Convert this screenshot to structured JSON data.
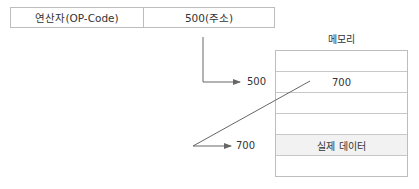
{
  "instruction": {
    "opcode_label": "연산자(OP-Code)",
    "operand_label": "500(주소)"
  },
  "memory": {
    "title": "메모리",
    "rows": [
      "",
      "700",
      "",
      "",
      "실제 데이터",
      ""
    ],
    "highlight_row_index": 4
  },
  "pointers": {
    "first_address": "500",
    "second_address": "700"
  },
  "colors": {
    "line": "#666666",
    "border": "#bdbdbd",
    "highlight_fill": "#f2f2f2"
  }
}
